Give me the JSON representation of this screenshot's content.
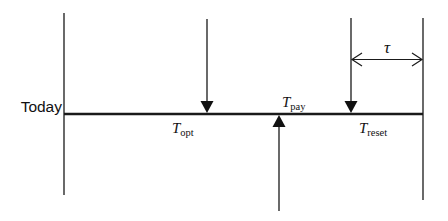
{
  "diagram": {
    "type": "timeline",
    "colors": {
      "line": "#1a1a1a",
      "text": "#111111",
      "background": "#ffffff"
    },
    "start_label": "Today",
    "events": [
      {
        "id": "opt",
        "symbol": "T",
        "subscript": "opt",
        "direction": "down"
      },
      {
        "id": "pay",
        "symbol": "T",
        "subscript": "pay",
        "direction": "up"
      },
      {
        "id": "reset",
        "symbol": "T",
        "subscript": "reset",
        "direction": "down"
      }
    ],
    "interval": {
      "symbol": "τ",
      "from": "reset",
      "to": "end"
    }
  }
}
